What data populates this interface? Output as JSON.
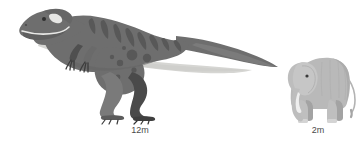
{
  "figure": {
    "type": "size-comparison-illustration",
    "background_color": "#ffffff",
    "title": "",
    "subjects": [
      {
        "name": "tyrannosaurus-rex",
        "label": "12m",
        "height_meters": 12,
        "facing": "left",
        "colors": {
          "body": "#6e6e6e",
          "body_shadow": "#5d5d5d",
          "belly": "#d2d2cf",
          "stripes": "#5a5a5a",
          "spots": "#585858",
          "far_limb": "#4a4a4a",
          "near_limb": "#7a7a7a",
          "claw": "#3c3c3c"
        }
      },
      {
        "name": "elephant",
        "label": "2m",
        "height_meters": 2,
        "facing": "left",
        "colors": {
          "body": "#b9b9b9",
          "body_shadow": "#a8a8a8",
          "ear": "#c4c4c4",
          "tusk": "#efefef",
          "eye": "#3a3a3a",
          "far_limb": "#a0a0a0"
        }
      }
    ]
  },
  "labels": {
    "dinosaur": "12m",
    "elephant": "2m",
    "text_color": "#4a4a4a"
  }
}
